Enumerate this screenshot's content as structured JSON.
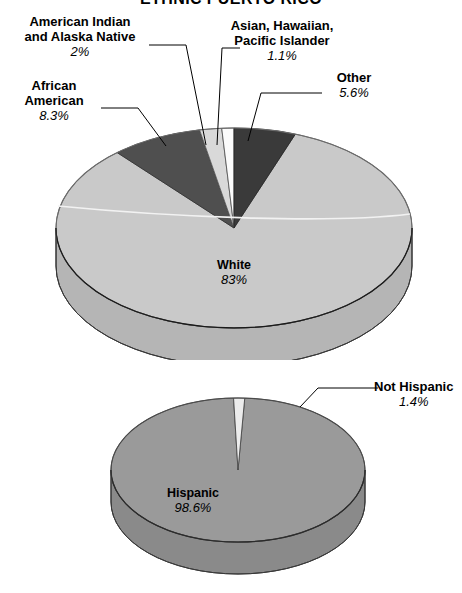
{
  "title": "ETHNIC PUERTO RICO",
  "chart_data": [
    {
      "type": "pie",
      "title": "ETHNIC PUERTO RICO",
      "id": "race-pie",
      "labels": [
        "White",
        "African American",
        "American Indian and Alaska Native",
        "Asian, Hawaiian, Pacific Islander",
        "Other"
      ],
      "values": [
        83,
        8.3,
        2,
        1.1,
        5.6
      ],
      "value_labels": [
        "83%",
        "8.3%",
        "2%",
        "1.1%",
        "5.6%"
      ],
      "colors": [
        "#c9c9c9",
        "#4f4f4f",
        "#d9d9d9",
        "#fbfbfb",
        "#3a3a3a"
      ],
      "legend": "none",
      "grid": false
    },
    {
      "type": "pie",
      "id": "hispanic-pie",
      "labels": [
        "Hispanic",
        "Not Hispanic"
      ],
      "values": [
        98.6,
        1.4
      ],
      "value_labels": [
        "98.6%",
        "1.4%"
      ],
      "colors": [
        "#9a9a9a",
        "#ececec"
      ],
      "legend": "none",
      "grid": false
    }
  ],
  "pie1": {
    "callouts": [
      {
        "name": "american-indian",
        "line1": "American Indian",
        "line2": "and Alaska Native",
        "pct": "2%"
      },
      {
        "name": "african-american",
        "line1": "African",
        "line2": "American",
        "pct": "8.3%"
      },
      {
        "name": "asian-hawaiian-pi",
        "line1": "Asian, Hawaiian,",
        "line2": "Pacific Islander",
        "pct": "1.1%"
      },
      {
        "name": "other",
        "line1": "Other",
        "line2": "",
        "pct": "5.6%"
      }
    ],
    "inside": {
      "name": "white",
      "label": "White",
      "pct": "83%"
    }
  },
  "pie2": {
    "callouts": [
      {
        "name": "not-hispanic",
        "line1": "Not Hispanic",
        "line2": "",
        "pct": "1.4%"
      }
    ],
    "inside": {
      "name": "hispanic",
      "label": "Hispanic",
      "pct": "98.6%"
    }
  }
}
